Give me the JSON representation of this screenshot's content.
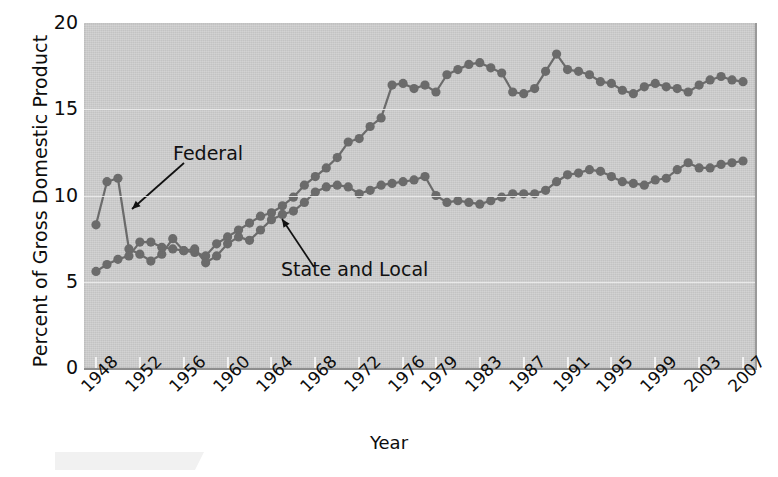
{
  "chart_data": {
    "type": "line",
    "title": "",
    "xlabel": "Year",
    "ylabel": "Percent of Gross Domestic Product",
    "ylim": [
      0,
      20
    ],
    "yticks": [
      0,
      5,
      10,
      15,
      20
    ],
    "xlim": [
      1948,
      2007
    ],
    "xticks": [
      1948,
      1952,
      1956,
      1960,
      1964,
      1968,
      1972,
      1976,
      1979,
      1983,
      1987,
      1991,
      1995,
      1999,
      2003,
      2007
    ],
    "xtick_labels": [
      "1948",
      "1952",
      "1956",
      "1960",
      "1964",
      "1968",
      "1972",
      "1976",
      "1979",
      "1983",
      "1987",
      "1991",
      "1995",
      "1999",
      "2003",
      "2007"
    ],
    "grid": true,
    "legend_position": "annotations-on-plot",
    "annotations": [
      {
        "text": "Federal",
        "points_to_series": "Federal",
        "points_to_year": 1952
      },
      {
        "text": "State and Local",
        "points_to_series": "State and Local",
        "points_to_year": 1980
      }
    ],
    "x": [
      1948,
      1949,
      1950,
      1951,
      1952,
      1953,
      1954,
      1955,
      1956,
      1957,
      1958,
      1959,
      1960,
      1961,
      1962,
      1963,
      1964,
      1965,
      1966,
      1967,
      1968,
      1969,
      1970,
      1971,
      1972,
      1973,
      1974,
      1975,
      1976,
      1977,
      1978,
      1979,
      1980,
      1981,
      1982,
      1983,
      1984,
      1985,
      1986,
      1987,
      1988,
      1989,
      1990,
      1991,
      1992,
      1993,
      1994,
      1995,
      1996,
      1997,
      1998,
      1999,
      2000,
      2001,
      2002,
      2003,
      2004,
      2005,
      2006,
      2007
    ],
    "series": [
      {
        "name": "Federal",
        "color": "#6b6b6b",
        "values": [
          8.3,
          10.8,
          11.0,
          6.9,
          6.6,
          6.2,
          6.6,
          7.5,
          6.8,
          6.7,
          6.5,
          7.2,
          7.6,
          8.0,
          8.4,
          8.8,
          9.0,
          9.4,
          9.9,
          10.6,
          11.1,
          11.6,
          12.2,
          13.1,
          13.3,
          14.0,
          14.5,
          16.4,
          16.5,
          16.2,
          16.4,
          16.0,
          17.0,
          17.3,
          17.6,
          17.7,
          17.4,
          17.1,
          16.0,
          15.9,
          16.2,
          17.2,
          18.2,
          17.3,
          17.2,
          17.0,
          16.6,
          16.5,
          16.1,
          15.9,
          16.3,
          16.5,
          16.3,
          16.2,
          16.0,
          16.4,
          16.7,
          16.9,
          16.7,
          16.6
        ]
      },
      {
        "name": "State and Local",
        "color": "#6b6b6b",
        "values": [
          5.6,
          6.0,
          6.3,
          6.5,
          7.3,
          7.3,
          7.0,
          6.9,
          6.8,
          6.9,
          6.1,
          6.5,
          7.2,
          7.6,
          7.4,
          8.0,
          8.6,
          8.9,
          9.1,
          9.6,
          10.2,
          10.5,
          10.6,
          10.5,
          10.1,
          10.3,
          10.6,
          10.7,
          10.8,
          10.9,
          11.1,
          10.0,
          9.6,
          9.7,
          9.6,
          9.5,
          9.7,
          9.9,
          10.1,
          10.1,
          10.1,
          10.3,
          10.8,
          11.2,
          11.3,
          11.5,
          11.4,
          11.1,
          10.8,
          10.7,
          10.6,
          10.9,
          11.0,
          11.5,
          11.9,
          11.6,
          11.6,
          11.8,
          11.9,
          12.0
        ]
      }
    ]
  }
}
